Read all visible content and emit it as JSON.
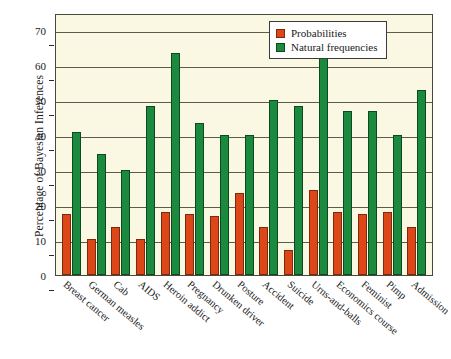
{
  "chart_data": {
    "type": "bar",
    "title": "",
    "xlabel": "",
    "ylabel": "Percentage of Bayesian Inferences",
    "ylim": [
      0,
      75
    ],
    "yticks": [
      0,
      10,
      20,
      30,
      40,
      50,
      60,
      70
    ],
    "grid": true,
    "legend_position": "top-right",
    "colors": {
      "probabilities": "#dd4718",
      "natural_frequencies": "#1b8a3e",
      "plot_background": "#faf7e2",
      "axis": "#4a4a3c"
    },
    "categories": [
      "Breast cancer",
      "German measles",
      "Cab",
      "AIDS",
      "Heroin addict",
      "Pregnancy",
      "Drunken driver",
      "Posture",
      "Accident",
      "Suicide",
      "Urns-and-balls",
      "Economics course",
      "Feminist",
      "Pimp",
      "Admission"
    ],
    "series": [
      {
        "name": "Probabilities",
        "values": [
          17.5,
          10.2,
          13.8,
          10.2,
          18.0,
          17.5,
          17.0,
          23.5,
          13.8,
          7.2,
          24.2,
          18.0,
          17.5,
          18.0,
          13.8
        ]
      },
      {
        "name": "Natural frequencies",
        "values": [
          41.0,
          34.5,
          30.0,
          48.5,
          63.5,
          43.5,
          40.0,
          40.0,
          50.0,
          48.5,
          62.0,
          47.0,
          47.0,
          40.0,
          53.0
        ]
      }
    ]
  }
}
